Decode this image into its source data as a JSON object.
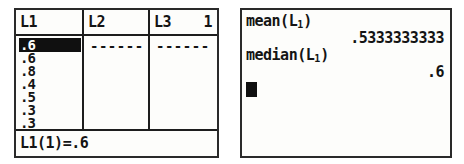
{
  "device": {
    "type": "graphing-calculator",
    "ink_color": "#141414",
    "screen_background": "#fdfdfb",
    "border_color": "#2a2a2a"
  },
  "list_editor": {
    "columns": [
      {
        "header": "L1",
        "name": "L1"
      },
      {
        "header": "L2",
        "name": "L2"
      },
      {
        "header": "L3",
        "name": "L3"
      }
    ],
    "active_column_number": "1",
    "l1_values": [
      ".6",
      ".6",
      ".8",
      ".4",
      ".5",
      ".3",
      ".3",
      ".7"
    ],
    "l1_selected_index": 0,
    "l2_placeholder": "------",
    "l3_placeholder": "------",
    "status_line": {
      "label": "L1(1)=",
      "value": ".6",
      "full": "L1(1)=.6"
    }
  },
  "home_screen": {
    "lines": [
      {
        "kind": "entry",
        "text": "mean(L₁)",
        "base": "mean(L",
        "sub": "1",
        "tail": ")"
      },
      {
        "kind": "answer",
        "text": ".5333333333"
      },
      {
        "kind": "entry",
        "text": "median(L₁)",
        "base": "median(L",
        "sub": "1",
        "tail": ")"
      },
      {
        "kind": "answer",
        "text": ".6"
      }
    ],
    "cursor": "block"
  },
  "chart_data": {
    "type": "table",
    "categories": [
      "1",
      "2",
      "3",
      "4",
      "5",
      "6",
      "7",
      "8"
    ],
    "values": [
      0.6,
      0.6,
      0.8,
      0.4,
      0.5,
      0.3,
      0.3,
      0.7
    ],
    "statistics": {
      "mean": 0.5333333333,
      "median": 0.6
    },
    "xlabel": "index",
    "ylabel": "L1"
  }
}
